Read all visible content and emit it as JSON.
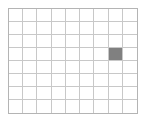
{
  "widget": {
    "name": "pixel-grid",
    "columns": 9,
    "rows": 8,
    "background_color": "#ffffff",
    "gridline_color": "#c8c8c8",
    "border_color": "#b4b4b4",
    "fill_color": "#808080",
    "filled_cells": [
      {
        "column": 7,
        "row": 3
      }
    ],
    "cells": [
      [
        0,
        0,
        0,
        0,
        0,
        0,
        0,
        0,
        0
      ],
      [
        0,
        0,
        0,
        0,
        0,
        0,
        0,
        0,
        0
      ],
      [
        0,
        0,
        0,
        0,
        0,
        0,
        0,
        0,
        0
      ],
      [
        0,
        0,
        0,
        0,
        0,
        0,
        0,
        1,
        0
      ],
      [
        0,
        0,
        0,
        0,
        0,
        0,
        0,
        0,
        0
      ],
      [
        0,
        0,
        0,
        0,
        0,
        0,
        0,
        0,
        0
      ],
      [
        0,
        0,
        0,
        0,
        0,
        0,
        0,
        0,
        0
      ],
      [
        0,
        0,
        0,
        0,
        0,
        0,
        0,
        0,
        0
      ]
    ]
  }
}
